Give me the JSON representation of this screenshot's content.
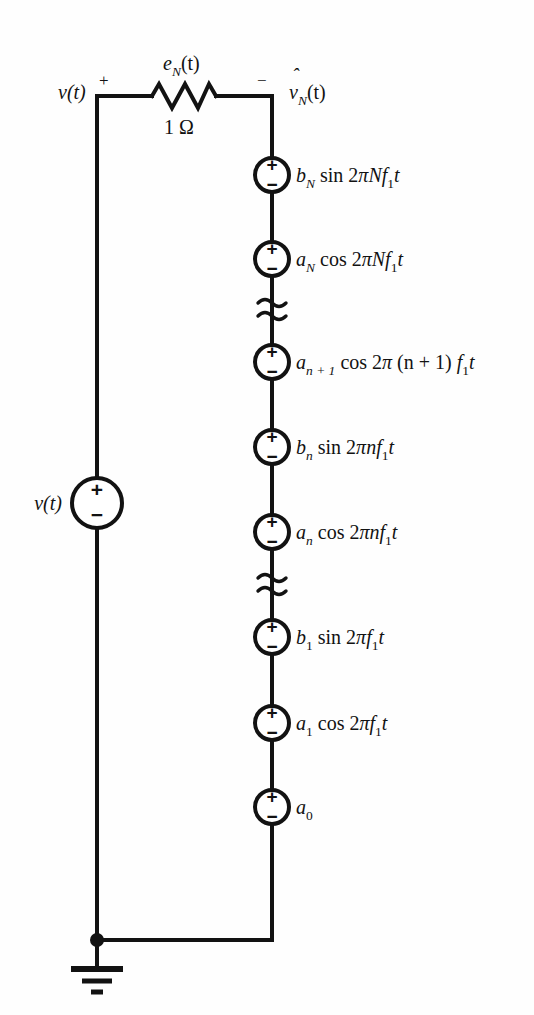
{
  "figure": {
    "type": "circuit-diagram",
    "background_color": "#fefefe",
    "line_color": "#121212"
  },
  "source_left": {
    "label": "v(t)",
    "plus": "+",
    "minus": "−"
  },
  "top_branch": {
    "terminal_plus": "+",
    "terminal_minus": "−",
    "input_label": "v(t)",
    "resistor_label": "e",
    "resistor_label_sub": "N",
    "resistor_label_arg": "(t)",
    "resistor_value": "1 Ω",
    "output_label_v": "v",
    "output_label_sub": "N",
    "output_label_arg": "(t)",
    "output_hat": "ˆ"
  },
  "ground": {
    "name": "ground-symbol",
    "bars": 3
  },
  "sources": [
    {
      "id": "b-N",
      "plus": "+",
      "minus": "−",
      "label_parts": [
        {
          "text": "b",
          "style": "italic"
        },
        {
          "text": "N",
          "style": "sub-italic"
        },
        {
          "text": "  sin 2",
          "style": "roman"
        },
        {
          "text": "π",
          "style": "italic-greek"
        },
        {
          "text": "Nf",
          "style": "italic"
        },
        {
          "text": "1",
          "style": "sub-roman"
        },
        {
          "text": "t",
          "style": "italic"
        }
      ],
      "label_plain": "b_N sin 2πNf_1 t"
    },
    {
      "id": "a-N",
      "plus": "+",
      "minus": "−",
      "label_parts": [
        {
          "text": "a",
          "style": "italic"
        },
        {
          "text": "N",
          "style": "sub-italic"
        },
        {
          "text": "  cos 2",
          "style": "roman"
        },
        {
          "text": "π",
          "style": "italic-greek"
        },
        {
          "text": "Nf",
          "style": "italic"
        },
        {
          "text": "1",
          "style": "sub-roman"
        },
        {
          "text": "t",
          "style": "italic"
        }
      ],
      "label_plain": "a_N cos 2πNf_1 t"
    },
    {
      "id": "a-n-plus-1",
      "plus": "+",
      "minus": "−",
      "label_parts": [
        {
          "text": "a",
          "style": "italic"
        },
        {
          "text": "n + 1",
          "style": "sub-italic"
        },
        {
          "text": "  cos 2",
          "style": "roman"
        },
        {
          "text": "π",
          "style": "italic-greek"
        },
        {
          "text": " (n + 1) ",
          "style": "italic"
        },
        {
          "text": "f",
          "style": "italic"
        },
        {
          "text": "1",
          "style": "sub-roman"
        },
        {
          "text": "t",
          "style": "italic"
        }
      ],
      "label_plain": "a_{n+1} cos 2π (n + 1) f_1 t"
    },
    {
      "id": "b-n",
      "plus": "+",
      "minus": "−",
      "label_parts": [
        {
          "text": "b",
          "style": "italic"
        },
        {
          "text": "n",
          "style": "sub-italic"
        },
        {
          "text": "  sin 2",
          "style": "roman"
        },
        {
          "text": "π",
          "style": "italic-greek"
        },
        {
          "text": "nf",
          "style": "italic"
        },
        {
          "text": "1",
          "style": "sub-roman"
        },
        {
          "text": "t",
          "style": "italic"
        }
      ],
      "label_plain": "b_n sin 2πnf_1 t"
    },
    {
      "id": "a-n",
      "plus": "+",
      "minus": "−",
      "label_parts": [
        {
          "text": "a",
          "style": "italic"
        },
        {
          "text": "n",
          "style": "sub-italic"
        },
        {
          "text": "  cos 2",
          "style": "roman"
        },
        {
          "text": "π",
          "style": "italic-greek"
        },
        {
          "text": "nf",
          "style": "italic"
        },
        {
          "text": "1",
          "style": "sub-roman"
        },
        {
          "text": "t",
          "style": "italic"
        }
      ],
      "label_plain": "a_n cos 2πnf_1 t"
    },
    {
      "id": "b-1",
      "plus": "+",
      "minus": "−",
      "label_parts": [
        {
          "text": "b",
          "style": "italic"
        },
        {
          "text": "1",
          "style": "sub-roman"
        },
        {
          "text": "  sin 2",
          "style": "roman"
        },
        {
          "text": "π",
          "style": "italic-greek"
        },
        {
          "text": "f",
          "style": "italic"
        },
        {
          "text": "1",
          "style": "sub-roman"
        },
        {
          "text": "t",
          "style": "italic"
        }
      ],
      "label_plain": "b_1 sin 2πf_1 t"
    },
    {
      "id": "a-1",
      "plus": "+",
      "minus": "−",
      "label_parts": [
        {
          "text": "a",
          "style": "italic"
        },
        {
          "text": "1",
          "style": "sub-roman"
        },
        {
          "text": "  cos 2",
          "style": "roman"
        },
        {
          "text": "π",
          "style": "italic-greek"
        },
        {
          "text": "f",
          "style": "italic"
        },
        {
          "text": "1",
          "style": "sub-roman"
        },
        {
          "text": "t",
          "style": "italic"
        }
      ],
      "label_plain": "a_1 cos 2πf_1 t"
    },
    {
      "id": "a-0",
      "plus": "+",
      "minus": "−",
      "label_parts": [
        {
          "text": "a",
          "style": "italic"
        },
        {
          "text": "0",
          "style": "sub-roman"
        }
      ],
      "label_plain": "a_0"
    }
  ],
  "breaks": [
    {
      "id": "break-upper",
      "symbol": "series-continuation"
    },
    {
      "id": "break-lower",
      "symbol": "series-continuation"
    }
  ]
}
